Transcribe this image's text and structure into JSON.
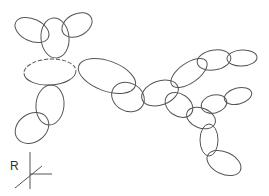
{
  "diagram": {
    "type": "ellipse-linkage-sketch",
    "stroke_color": "#555555",
    "background": "#ffffff",
    "ellipses": [
      {
        "id": "ear-left",
        "cx": 32,
        "cy": 30,
        "rx": 18,
        "ry": 11,
        "rot": 25
      },
      {
        "id": "head",
        "cx": 55,
        "cy": 38,
        "rx": 14,
        "ry": 20,
        "rot": -5
      },
      {
        "id": "ear-right",
        "cx": 77,
        "cy": 25,
        "rx": 16,
        "ry": 11,
        "rot": -28
      },
      {
        "id": "torso",
        "cx": 50,
        "cy": 72,
        "rx": 26,
        "ry": 13,
        "rot": -3,
        "dashed_top": true
      },
      {
        "id": "left-arm-upper",
        "cx": 50,
        "cy": 105,
        "rx": 14,
        "ry": 20,
        "rot": 5
      },
      {
        "id": "left-arm-lower",
        "cx": 32,
        "cy": 128,
        "rx": 18,
        "ry": 14,
        "rot": -35
      },
      {
        "id": "right-arm",
        "cx": 107,
        "cy": 76,
        "rx": 30,
        "ry": 15,
        "rot": 20
      },
      {
        "id": "link-1",
        "cx": 128,
        "cy": 97,
        "rx": 17,
        "ry": 14,
        "rot": 30
      },
      {
        "id": "center",
        "cx": 160,
        "cy": 93,
        "rx": 19,
        "ry": 12,
        "rot": -20
      },
      {
        "id": "upper-chain-1",
        "cx": 189,
        "cy": 73,
        "rx": 21,
        "ry": 10,
        "rot": -35
      },
      {
        "id": "upper-chain-2",
        "cx": 214,
        "cy": 60,
        "rx": 17,
        "ry": 10,
        "rot": -10
      },
      {
        "id": "upper-chain-3",
        "cx": 242,
        "cy": 58,
        "rx": 15,
        "ry": 8,
        "rot": -3
      },
      {
        "id": "lower-chain-1",
        "cx": 179,
        "cy": 105,
        "rx": 15,
        "ry": 11,
        "rot": 35
      },
      {
        "id": "branch-right-1",
        "cx": 214,
        "cy": 104,
        "rx": 13,
        "ry": 9,
        "rot": -15
      },
      {
        "id": "branch-right-2",
        "cx": 238,
        "cy": 96,
        "rx": 14,
        "ry": 8,
        "rot": -15
      },
      {
        "id": "lower-chain-2",
        "cx": 201,
        "cy": 118,
        "rx": 15,
        "ry": 10,
        "rot": 22
      },
      {
        "id": "lower-vertical",
        "cx": 209,
        "cy": 140,
        "rx": 9,
        "ry": 16,
        "rot": 0
      },
      {
        "id": "bottom",
        "cx": 224,
        "cy": 163,
        "rx": 18,
        "ry": 11,
        "rot": 25
      }
    ],
    "axes": {
      "label": "R",
      "label_x": 10,
      "label_y": 170,
      "vertical": {
        "x1": 30,
        "y1": 152,
        "x2": 30,
        "y2": 189
      },
      "horizontal": {
        "x1": 30,
        "y1": 174,
        "x2": 52,
        "y2": 174
      },
      "diagonal": {
        "x1": 15,
        "y1": 188,
        "x2": 42,
        "y2": 166
      }
    }
  }
}
